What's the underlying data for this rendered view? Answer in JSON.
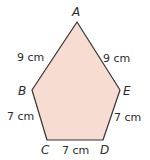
{
  "figure": {
    "shape": "pentagon",
    "fill_color": "#f7dcd1",
    "stroke_color": "#333333",
    "vertices": [
      {
        "name": "A",
        "x": 77,
        "y": 22
      },
      {
        "name": "E",
        "x": 120,
        "y": 90
      },
      {
        "name": "D",
        "x": 103,
        "y": 140
      },
      {
        "name": "C",
        "x": 47,
        "y": 140
      },
      {
        "name": "B",
        "x": 32,
        "y": 90
      }
    ],
    "labels": {
      "A": "A",
      "B": "B",
      "C": "C",
      "D": "D",
      "E": "E"
    },
    "sides": {
      "AB": "9 cm",
      "AE": "9 cm",
      "BC": "7 cm",
      "ED": "7 cm",
      "CD": "7 cm"
    }
  }
}
